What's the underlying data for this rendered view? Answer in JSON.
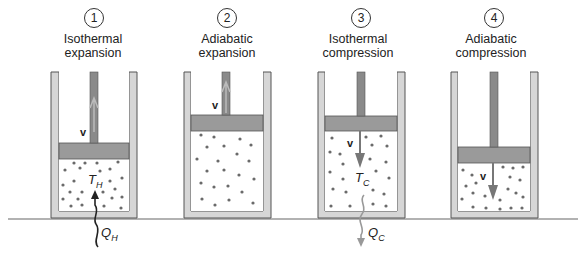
{
  "colors": {
    "wall": "#d6d6d6",
    "wall_border": "#555555",
    "piston": "#9a9a9a",
    "rod": "#8a8a8a",
    "molecule": "#6a6a6a",
    "heat_in": "#333333",
    "heat_out": "#999999",
    "ground": "#666666"
  },
  "stages": [
    {
      "number": "1",
      "line1": "Isothermal",
      "line2": "expansion",
      "temperature_symbol": "T",
      "temperature_sub": "H",
      "heat_symbol": "Q",
      "heat_sub": "H",
      "velocity": "v",
      "velocity_direction": "up"
    },
    {
      "number": "2",
      "line1": "Adiabatic",
      "line2": "expansion",
      "velocity": "v",
      "velocity_direction": "up"
    },
    {
      "number": "3",
      "line1": "Isothermal",
      "line2": "compression",
      "temperature_symbol": "T",
      "temperature_sub": "C",
      "heat_symbol": "Q",
      "heat_sub": "C",
      "velocity": "v",
      "velocity_direction": "down"
    },
    {
      "number": "4",
      "line1": "Adiabatic",
      "line2": "compression",
      "velocity": "v",
      "velocity_direction": "down"
    }
  ]
}
